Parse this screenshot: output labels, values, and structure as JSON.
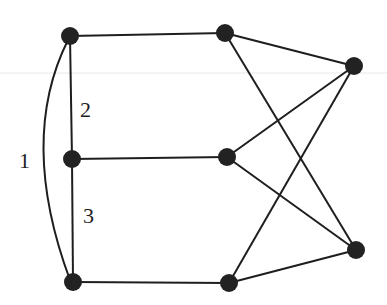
{
  "diagram": {
    "type": "graph",
    "nodes": [
      {
        "id": "L1",
        "x": 70,
        "y": 36
      },
      {
        "id": "L2",
        "x": 72,
        "y": 159
      },
      {
        "id": "L3",
        "x": 73,
        "y": 282
      },
      {
        "id": "M1",
        "x": 225,
        "y": 33
      },
      {
        "id": "M2",
        "x": 227,
        "y": 157
      },
      {
        "id": "M3",
        "x": 229,
        "y": 283
      },
      {
        "id": "R1",
        "x": 354,
        "y": 66
      },
      {
        "id": "R2",
        "x": 356,
        "y": 250
      }
    ],
    "edges": [
      {
        "from": "L1",
        "to": "L2",
        "label": "2"
      },
      {
        "from": "L2",
        "to": "L3",
        "label": "3"
      },
      {
        "from": "L1",
        "to": "L3",
        "label": "1",
        "curved": true
      },
      {
        "from": "L1",
        "to": "M1"
      },
      {
        "from": "L2",
        "to": "M2"
      },
      {
        "from": "L3",
        "to": "M3"
      },
      {
        "from": "M1",
        "to": "R1"
      },
      {
        "from": "M1",
        "to": "R2"
      },
      {
        "from": "M2",
        "to": "R1"
      },
      {
        "from": "M2",
        "to": "R2"
      },
      {
        "from": "M3",
        "to": "R1"
      },
      {
        "from": "M3",
        "to": "R2"
      }
    ],
    "labels": {
      "edge_1": "1",
      "edge_2": "2",
      "edge_3": "3"
    },
    "colors": {
      "stroke": "#1e1e1e",
      "node": "#222222",
      "background": "#ffffff"
    }
  }
}
